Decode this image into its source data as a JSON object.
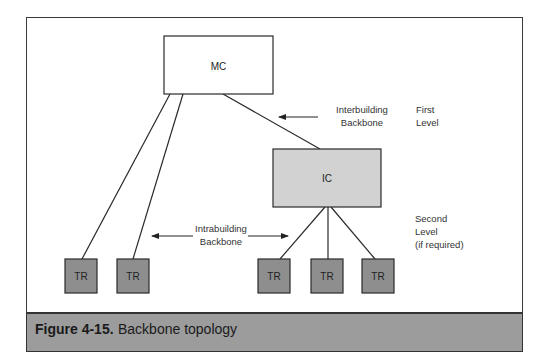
{
  "figure": {
    "number": "Figure 4-15.",
    "title": "Backbone topology"
  },
  "nodes": {
    "mc": {
      "label": "MC",
      "fill": "#ffffff"
    },
    "ic": {
      "label": "IC",
      "fill": "#d2d2d2"
    },
    "tr": [
      {
        "label": "TR",
        "fill": "#8e8e8e"
      },
      {
        "label": "TR",
        "fill": "#8e8e8e"
      },
      {
        "label": "TR",
        "fill": "#8e8e8e"
      },
      {
        "label": "TR",
        "fill": "#8e8e8e"
      },
      {
        "label": "TR",
        "fill": "#8e8e8e"
      }
    ]
  },
  "annotations": {
    "interbuilding": {
      "line1": "Interbuilding",
      "line2": "Backbone"
    },
    "intrabuilding": {
      "line1": "Intrabuilding",
      "line2": "Backbone"
    },
    "first_level": {
      "line1": "First",
      "line2": "Level"
    },
    "second_level": {
      "line1": "Second",
      "line2": "Level",
      "line3": "(if required)"
    }
  },
  "edges": [
    {
      "from": "MC",
      "to": "TR-1"
    },
    {
      "from": "MC",
      "to": "TR-2"
    },
    {
      "from": "MC",
      "to": "IC"
    },
    {
      "from": "IC",
      "to": "TR-3"
    },
    {
      "from": "IC",
      "to": "TR-4"
    },
    {
      "from": "IC",
      "to": "TR-5"
    }
  ],
  "colors": {
    "caption_bg": "#9c9c9c",
    "line": "#2a2a2a"
  }
}
